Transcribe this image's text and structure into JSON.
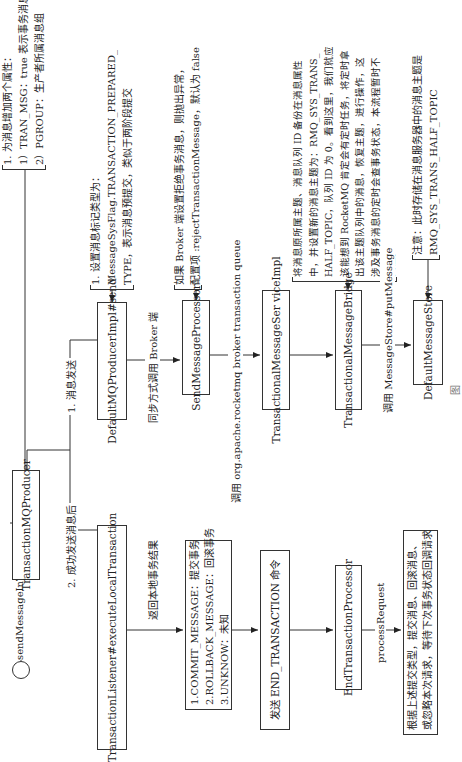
{
  "start": {
    "label": "sendMessageInTransaction"
  },
  "nodes": {
    "producer": "TransactionMQProducer",
    "default_impl": "DefaultMQProducerImpl#send",
    "send_processor": "SendMessageProcessor",
    "service_impl": "TransactionalMessageSer viceImpl",
    "bridge": "TransactionalMessageBridge",
    "store": "DefaultMessageStore",
    "listener": "TransactionListener#executeLocalTransaction",
    "end_processor": "EndTransactionProcessor"
  },
  "result_box": {
    "lines": [
      "1.COMMIT_MESSAGE：提交事务",
      "2.ROLLBACK_MESSAGE：回滚事务",
      "3.UNKNOW：未知"
    ]
  },
  "end_tx_box": {
    "label": "发送 END_TRANSACTION 命令"
  },
  "final_box": {
    "lines": [
      "根据上述提交类型，提交消息、回滚消息、",
      "或忽略本次请求，等待下次事务状态回调请求"
    ]
  },
  "notes": {
    "properties": [
      "1. 为消息增加两个属性：",
      "1）TRAN_MSG：true 表示事务消息",
      "2）PGROUP：生产者所属消息组"
    ],
    "prepared": [
      "1. 设置消息标记类型为：",
      "MessageSysFlag.TRANSACTION_PREPARED_",
      "TYPE，表示消息预提交，类似于两阶段提交"
    ],
    "reject": [
      "如果 Broker 端设置拒绝事务消息，则抛出异常，",
      "配置项 :rejectTransactionMessage，默认为 false"
    ],
    "backup": [
      "将消息原所属主题、消息队列 ID 备份在消息属性",
      "中，并设置新的消息主题为：RMQ_SYS_TRANS_",
      "HALF_TOPIC，队列 ID 为 0。看到这里，我们就应",
      "该能想到 RocketMQ 肯定会有定时任务，将定时拿",
      "出该主题队列中的消息，恢复主题，进行操作，这",
      "涉及事务消息的定时会查事务状态，本流程暂时不",
      "关注。"
    ],
    "storage": [
      "注意：此时存储在消息服务器中的消息主题是",
      "RMQ_SYS_TRANS_HALF_TOPIC"
    ]
  },
  "edge_labels": {
    "send_msg": "1. 消息发送",
    "after_send": "2. 成功发送消息后",
    "sync_call": "同步方式调用 Broker 端",
    "call_queue": "调用 org.apache.rocketmq broker transaction queue",
    "put_message": "调用 MessageStore#putMessage",
    "return_result": "返回本地事务结果",
    "process_request": "processRequest"
  },
  "caption": "图"
}
